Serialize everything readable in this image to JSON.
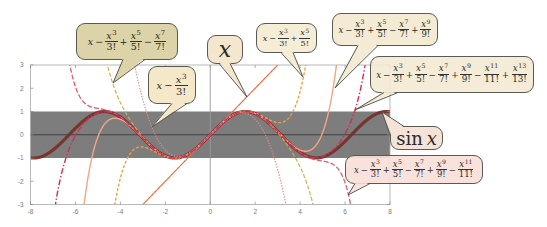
{
  "chart_data": {
    "type": "line",
    "title": "",
    "xlabel": "",
    "ylabel": "",
    "xlim": [
      -8,
      8
    ],
    "ylim": [
      -3,
      3
    ],
    "xticks": [
      -8,
      -6,
      -4,
      -2,
      0,
      2,
      4,
      6,
      8
    ],
    "xtick_labels": [
      "-8",
      "-6",
      "-4",
      "-2",
      "0",
      "2",
      "4",
      "6",
      "8"
    ],
    "yticks": [
      -3,
      -2,
      -1,
      0,
      1,
      2,
      3
    ],
    "ytick_labels": [
      "-3",
      "-2",
      "-1",
      "0",
      "1",
      "2",
      "3"
    ],
    "grid": false,
    "legend": "none (curves labeled by callout bubbles)",
    "shaded_band": {
      "y_from": -1,
      "y_to": 1,
      "color": "#7d7d7d"
    },
    "reference_lines": [
      {
        "axis": "y",
        "value": 0,
        "color": "#3c3c3c"
      },
      {
        "axis": "x",
        "value": 0,
        "color": "#9a9a9a"
      }
    ],
    "x_samples": [
      -6,
      -4,
      -2,
      0,
      2,
      4,
      6
    ],
    "series": [
      {
        "name": "sin x",
        "function": "sin",
        "degree": null,
        "color": "#7a2e28",
        "style": "solid",
        "width": 3.2,
        "dash": "",
        "opacity": 0.92,
        "values": [
          0.279,
          0.757,
          -0.909,
          0,
          0.909,
          -0.757,
          -0.279
        ]
      },
      {
        "name": "x",
        "function": "taylor_sin",
        "degree": 1,
        "color": "#ee6a3c",
        "style": "solid",
        "width": 1.2,
        "dash": "",
        "values": [
          -6,
          -4,
          -2,
          0,
          2,
          4,
          6
        ]
      },
      {
        "name": "x − x³/3!",
        "function": "taylor_sin",
        "degree": 3,
        "color": "#e88a78",
        "style": "dotted",
        "width": 1.2,
        "dash": "1.3 1.5",
        "values": [
          30,
          6.667,
          -0.667,
          0,
          0.667,
          -6.667,
          -30
        ]
      },
      {
        "name": "x − x³/3! + x⁵/5!",
        "function": "taylor_sin",
        "degree": 5,
        "color": "#f0a040",
        "style": "dashed",
        "width": 1.4,
        "dash": "3 1.8",
        "values": [
          -34.8,
          -1.867,
          -0.933,
          0,
          0.933,
          1.867,
          34.8
        ]
      },
      {
        "name": "x − x³/3! + x⁵/5! − x⁷/7!",
        "function": "taylor_sin",
        "degree": 7,
        "color": "#c8b448",
        "style": "dashed",
        "width": 1.2,
        "dash": "4 2",
        "values": [
          20.74,
          1.384,
          -0.908,
          0,
          0.908,
          -1.384,
          -20.74
        ]
      },
      {
        "name": "x − x³/3! + x⁵/5! − x⁷/7! + x⁹/9!",
        "function": "taylor_sin",
        "degree": 9,
        "color": "#f2a684",
        "style": "solid",
        "width": 1.4,
        "dash": "",
        "values": [
          -7.03,
          0.662,
          -0.909,
          0,
          0.909,
          -0.662,
          7.03
        ]
      },
      {
        "name": "x − x³/3! + x⁵/5! − x⁷/7! + x⁹/9! − x¹¹/11!",
        "function": "taylor_sin",
        "degree": 11,
        "color": "#e25a6c",
        "style": "dashed",
        "width": 1.3,
        "dash": "5 2",
        "values": [
          2.06,
          0.767,
          -0.909,
          0,
          0.909,
          -0.767,
          -2.06
        ]
      },
      {
        "name": "x − x³/3! + x⁵/5! − x⁷/7! + x⁹/9! − x¹¹/11! + x¹³/13!",
        "function": "taylor_sin",
        "degree": 13,
        "color": "#d42c54",
        "style": "dash-dot",
        "width": 1.4,
        "dash": "6 2 1.5 2",
        "values": [
          -0.037,
          0.756,
          -0.909,
          0,
          0.909,
          -0.756,
          0.037
        ]
      }
    ]
  },
  "bubbles": [
    {
      "name": "taylor-deg7",
      "fill": "#dcd3a9",
      "lead": "x",
      "terms": [
        {
          "sign": "−",
          "var": "x",
          "exp": "3",
          "den": "3!"
        },
        {
          "sign": "+",
          "var": "x",
          "exp": "5",
          "den": "5!"
        },
        {
          "sign": "−",
          "var": "x",
          "exp": "7",
          "den": "7!"
        }
      ]
    },
    {
      "name": "taylor-deg3",
      "fill": "#f4e8c9",
      "lead": "x",
      "terms": [
        {
          "sign": "−",
          "var": "x",
          "exp": "3",
          "den": "3!"
        }
      ]
    },
    {
      "name": "taylor-deg1",
      "fill": "#f5e7cd",
      "lead": "x",
      "terms": []
    },
    {
      "name": "taylor-deg5",
      "fill": "#f5edd6",
      "lead": "x",
      "terms": [
        {
          "sign": "−",
          "var": "x",
          "exp": "3",
          "den": "3!"
        },
        {
          "sign": "+",
          "var": "x",
          "exp": "5",
          "den": "5!"
        }
      ]
    },
    {
      "name": "taylor-deg9",
      "fill": "#f4ebd4",
      "lead": "x",
      "terms": [
        {
          "sign": "−",
          "var": "x",
          "exp": "3",
          "den": "3!"
        },
        {
          "sign": "+",
          "var": "x",
          "exp": "5",
          "den": "5!"
        },
        {
          "sign": "−",
          "var": "x",
          "exp": "7",
          "den": "7!"
        },
        {
          "sign": "+",
          "var": "x",
          "exp": "9",
          "den": "9!"
        }
      ]
    },
    {
      "name": "taylor-deg13",
      "fill": "rgba(243,234,211,0.9)",
      "lead": "x",
      "terms": [
        {
          "sign": "−",
          "var": "x",
          "exp": "3",
          "den": "3!"
        },
        {
          "sign": "+",
          "var": "x",
          "exp": "5",
          "den": "5!"
        },
        {
          "sign": "−",
          "var": "x",
          "exp": "7",
          "den": "7!"
        },
        {
          "sign": "+",
          "var": "x",
          "exp": "9",
          "den": "9!"
        },
        {
          "sign": "−",
          "var": "x",
          "exp": "11",
          "den": "11!"
        },
        {
          "sign": "+",
          "var": "x",
          "exp": "13",
          "den": "13!"
        }
      ]
    },
    {
      "name": "sin-x",
      "fill": "#f6e3d7",
      "func": "sin",
      "lead": "x",
      "terms": []
    },
    {
      "name": "taylor-deg11",
      "fill": "rgba(248,222,216,0.9)",
      "lead": "x",
      "terms": [
        {
          "sign": "−",
          "var": "x",
          "exp": "3",
          "den": "3!"
        },
        {
          "sign": "+",
          "var": "x",
          "exp": "5",
          "den": "5!"
        },
        {
          "sign": "−",
          "var": "x",
          "exp": "7",
          "den": "7!"
        },
        {
          "sign": "+",
          "var": "x",
          "exp": "9",
          "den": "9!"
        },
        {
          "sign": "−",
          "var": "x",
          "exp": "11",
          "den": "11!"
        }
      ]
    }
  ]
}
